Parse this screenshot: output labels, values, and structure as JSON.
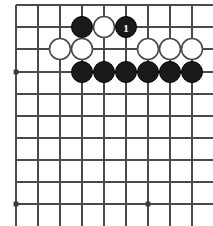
{
  "figure": {
    "kind": "go-board-diagram",
    "title": "",
    "caption": "",
    "width_px": 213,
    "height_px": 226
  },
  "board": {
    "background_color": "#ffffff",
    "line_color": "#4a4a4a",
    "line_width_px": 1.6,
    "cell_size_px": 22,
    "origin_x_px": 16,
    "origin_y_px": 5,
    "columns": 9,
    "rows": 10,
    "cropped_edges": [
      "right",
      "bottom"
    ],
    "vertical_line_x": [
      16,
      38,
      60,
      82,
      104,
      126,
      148,
      170,
      192
    ],
    "horizontal_line_y": [
      5,
      27,
      49,
      72,
      94,
      116,
      138,
      160,
      182,
      204
    ],
    "star_points": [
      {
        "name": "star-point-left-upper",
        "x": 16,
        "y": 72
      },
      {
        "name": "star-point-left-lower",
        "x": 16,
        "y": 204
      },
      {
        "name": "star-point-center-lower",
        "x": 148,
        "y": 204
      }
    ],
    "star_point_radius_px": 2.4
  },
  "stones": {
    "radius_px": 10.5,
    "items": [
      {
        "id": "b1",
        "color": "black",
        "x": 82,
        "y": 27,
        "label": ""
      },
      {
        "id": "w1",
        "color": "white",
        "x": 104,
        "y": 27,
        "label": ""
      },
      {
        "id": "b2",
        "color": "black",
        "x": 126,
        "y": 27,
        "label": "1"
      },
      {
        "id": "w2",
        "color": "white",
        "x": 60,
        "y": 49,
        "label": ""
      },
      {
        "id": "w3",
        "color": "white",
        "x": 82,
        "y": 49,
        "label": ""
      },
      {
        "id": "w4",
        "color": "white",
        "x": 148,
        "y": 49,
        "label": ""
      },
      {
        "id": "w5",
        "color": "white",
        "x": 170,
        "y": 49,
        "label": ""
      },
      {
        "id": "w6",
        "color": "white",
        "x": 192,
        "y": 49,
        "label": ""
      },
      {
        "id": "b3",
        "color": "black",
        "x": 82,
        "y": 72,
        "label": ""
      },
      {
        "id": "b4",
        "color": "black",
        "x": 104,
        "y": 72,
        "label": ""
      },
      {
        "id": "b5",
        "color": "black",
        "x": 126,
        "y": 72,
        "label": ""
      },
      {
        "id": "b6",
        "color": "black",
        "x": 148,
        "y": 72,
        "label": ""
      },
      {
        "id": "b7",
        "color": "black",
        "x": 170,
        "y": 72,
        "label": ""
      },
      {
        "id": "b8",
        "color": "black",
        "x": 192,
        "y": 72,
        "label": ""
      }
    ]
  },
  "colors": {
    "black_stone": "#1a1a1a",
    "white_stone": "#ffffff",
    "white_stone_outline": "#4a4a4a",
    "grid": "#4a4a4a",
    "label_on_black": "#ffffff",
    "page_background": "#ffffff"
  }
}
